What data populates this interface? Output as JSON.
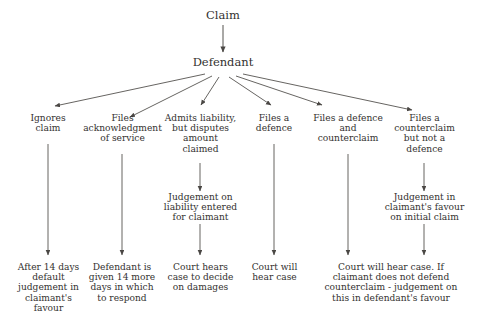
{
  "diagram": {
    "line_color": "#55524f",
    "text_color": "#33312f",
    "background_color": "#ffffff",
    "root": {
      "id": "claim",
      "label": "Claim"
    },
    "level1": {
      "id": "defendant",
      "label": "Defendant"
    },
    "branches": [
      {
        "id": "ignores-claim",
        "lines": [
          "Ignores",
          "claim"
        ],
        "outcome": {
          "id": "default-judgement",
          "lines": [
            "After 14 days",
            "default",
            "judgement in",
            "claimant's",
            "favour"
          ]
        }
      },
      {
        "id": "files-acknowledgment",
        "lines": [
          "Files",
          "acknowledgment",
          "of service"
        ],
        "outcome": {
          "id": "fourteen-more-days",
          "lines": [
            "Defendant is",
            "given 14 more",
            "days in which",
            "to respond"
          ]
        }
      },
      {
        "id": "admits-liability",
        "lines": [
          "Admits liability,",
          "but disputes",
          "amount",
          "claimed"
        ],
        "intermediate": {
          "id": "judgement-on-liability",
          "lines": [
            "Judgement on",
            "liability entered",
            "for claimant"
          ]
        },
        "outcome": {
          "id": "court-hears-damages",
          "lines": [
            "Court hears",
            "case to decide",
            "on damages"
          ]
        }
      },
      {
        "id": "files-defence",
        "lines": [
          "Files a",
          "defence"
        ],
        "outcome": {
          "id": "court-will-hear-case",
          "lines": [
            "Court will",
            "hear case"
          ]
        }
      },
      {
        "id": "files-defence-and-counterclaim",
        "lines": [
          "Files a defence",
          "and",
          "counterclaim"
        ]
      },
      {
        "id": "files-counterclaim-no-defence",
        "lines": [
          "Files a",
          "counterclaim",
          "but not a",
          "defence"
        ],
        "intermediate": {
          "id": "judgement-claimant-favour",
          "lines": [
            "Judgement in",
            "claimant's favour",
            "on initial claim"
          ]
        }
      }
    ],
    "shared_outcome": {
      "id": "court-hear-counterclaim",
      "lines": [
        "Court will hear case. If",
        "claimant does not defend",
        "counterclaim - judgement on",
        "this in defendant's favour"
      ]
    }
  }
}
